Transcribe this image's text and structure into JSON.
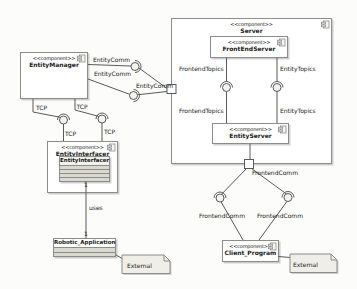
{
  "diagram": {
    "type": "uml-component-diagram",
    "nodes": {
      "entity_manager": {
        "stereotype": "<<component>>",
        "name": "EntityManager"
      },
      "server": {
        "stereotype": "<<component>>",
        "name": "Server"
      },
      "front_end_server": {
        "stereotype": "<<component>>",
        "name": "FrontEndServer"
      },
      "entity_server": {
        "stereotype": "<<component>>",
        "name": "EntityServer"
      },
      "entity_interfacer": {
        "stereotype": "<<component>>",
        "name": "EntityInterfacer"
      },
      "client_program": {
        "stereotype": "<<component>>",
        "name": "Client_Program"
      },
      "entity_interfacer_class": {
        "name": "EntityInterfacer"
      },
      "robotic_application": {
        "name": "Robotic_Application"
      }
    },
    "notes": {
      "left": {
        "text": "External"
      },
      "right": {
        "text": "External"
      }
    },
    "interface_labels": {
      "entitycomm_top": "EntityComm",
      "entitycomm_mid": "EntityComm",
      "entitycomm_port": "EntityComm",
      "tcp_upper_left": "TCP",
      "tcp_upper_right": "TCP",
      "tcp_lower_left": "TCP",
      "tcp_lower_right": "TCP",
      "frontendtopics_upper": "FrontendTopics",
      "frontendtopics_lower": "FrontendTopics",
      "entitytopics_upper": "EntityTopics",
      "entitytopics_lower": "EntityTopics",
      "frontendcomm_port": "FrontendComm",
      "frontendcomm_left": "FrontendComm",
      "frontendcomm_right": "FrontendComm"
    },
    "association": {
      "label": "uses",
      "mult_source": "1",
      "mult_target": "1"
    }
  },
  "colors": {
    "line": "#5a5a5a",
    "box_border": "#8c8c8c",
    "box_fill": "#ffffff",
    "compartment_fill": "#d9d9d0",
    "note_fill": "#efefe8",
    "text": "#1a1a1a"
  }
}
